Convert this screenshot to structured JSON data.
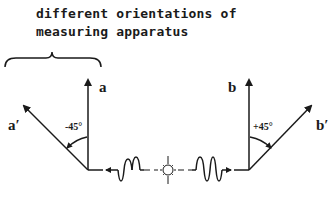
{
  "caption": {
    "line1": "different orientations of",
    "line2": "measuring apparatus"
  },
  "left_detector": {
    "vertical_label": "a",
    "rotated_label": "a′",
    "angle_label": "-45°",
    "rotation_degrees": -45
  },
  "right_detector": {
    "vertical_label": "b",
    "rotated_label": "b′",
    "angle_label": "+45°",
    "rotation_degrees": 45
  },
  "source": {
    "icon": "light-burst-icon"
  },
  "colors": {
    "ink": "#1a1a1a",
    "background": "#ffffff"
  }
}
